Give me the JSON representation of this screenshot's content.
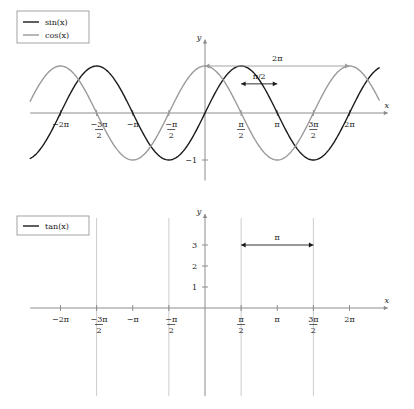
{
  "chart_data": [
    {
      "type": "line",
      "title": "",
      "xlabel": "x",
      "ylabel": "y",
      "xlim": [
        -7.6,
        7.6
      ],
      "ylim": [
        -1.35,
        1.35
      ],
      "grid": false,
      "legend_position": "top-left",
      "series": [
        {
          "name": "sin(x)",
          "color": "#1a1a1a",
          "function": "sin",
          "amplitude": 1,
          "phase": 0
        },
        {
          "name": "cos(x)",
          "color": "#9a9a9a",
          "function": "cos",
          "amplitude": 1,
          "phase": 1.5707963
        }
      ],
      "xticks": [
        {
          "value": -6.2831853,
          "label": "−2π",
          "type": "plain"
        },
        {
          "value": -4.712389,
          "label": "−3π/2",
          "type": "fraction",
          "sign": "−",
          "num": "3π",
          "den": "2"
        },
        {
          "value": -3.1415927,
          "label": "−π",
          "type": "plain"
        },
        {
          "value": -1.5707963,
          "label": "−π/2",
          "type": "fraction",
          "sign": "−",
          "num": "π",
          "den": "2"
        },
        {
          "value": 1.5707963,
          "label": "π/2",
          "type": "fraction",
          "sign": "",
          "num": "π",
          "den": "2"
        },
        {
          "value": 3.1415927,
          "label": "π",
          "type": "plain"
        },
        {
          "value": 4.712389,
          "label": "3π/2",
          "type": "fraction",
          "sign": "",
          "num": "3π",
          "den": "2"
        },
        {
          "value": 6.2831853,
          "label": "2π",
          "type": "plain"
        }
      ],
      "yticks": [
        {
          "value": -1,
          "label": "−1"
        }
      ],
      "annotations": [
        {
          "name": "period-arrow",
          "label": "2π",
          "x_start": 0,
          "x_end": 6.2831853,
          "y": 1.0,
          "color": "#9a9a9a"
        },
        {
          "name": "phase-shift-arrow",
          "label": "π/2",
          "x_start": 1.5707963,
          "x_end": 3.1415927,
          "y": 0.62,
          "color": "#1a1a1a"
        }
      ]
    },
    {
      "type": "line",
      "title": "",
      "xlabel": "x",
      "ylabel": "y",
      "xlim": [
        -7.6,
        7.6
      ],
      "ylim": [
        -4.2,
        3.9
      ],
      "grid": false,
      "legend_position": "top-left",
      "series": [
        {
          "name": "tan(x)",
          "color": "#1a1a1a",
          "function": "tan"
        }
      ],
      "asymptotes": [
        -4.712389,
        -1.5707963,
        1.5707963,
        4.712389
      ],
      "asymptote_color": "#cccccc",
      "xticks": [
        {
          "value": -6.2831853,
          "label": "−2π",
          "type": "plain"
        },
        {
          "value": -4.712389,
          "label": "−3π/2",
          "type": "fraction",
          "sign": "−",
          "num": "3π",
          "den": "2"
        },
        {
          "value": -3.1415927,
          "label": "−π",
          "type": "plain"
        },
        {
          "value": -1.5707963,
          "label": "−π/2",
          "type": "fraction",
          "sign": "−",
          "num": "π",
          "den": "2"
        },
        {
          "value": 1.5707963,
          "label": "π/2",
          "type": "fraction",
          "sign": "",
          "num": "π",
          "den": "2"
        },
        {
          "value": 3.1415927,
          "label": "π",
          "type": "plain"
        },
        {
          "value": 4.712389,
          "label": "3π/2",
          "type": "fraction",
          "sign": "",
          "num": "3π",
          "den": "2"
        },
        {
          "value": 6.2831853,
          "label": "2π",
          "type": "plain"
        }
      ],
      "yticks": [
        {
          "value": 1,
          "label": "1"
        },
        {
          "value": 2,
          "label": "2"
        },
        {
          "value": 3,
          "label": "3"
        }
      ],
      "annotations": [
        {
          "name": "period-arrow",
          "label": "π",
          "x_start": 1.5707963,
          "x_end": 4.712389,
          "y": 3.0,
          "color": "#1a1a1a"
        }
      ]
    }
  ],
  "style": {
    "axis_color": "#8c8c8c",
    "background": "#ffffff",
    "legend_border": "#8c8c8c",
    "curve_width": 1.4
  }
}
